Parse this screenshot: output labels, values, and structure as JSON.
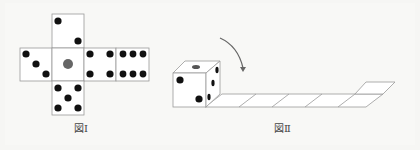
{
  "figure1": {
    "caption": "図Ⅰ",
    "faces": [
      {
        "position": "top",
        "pips": 2
      },
      {
        "position": "left",
        "pips": 3
      },
      {
        "position": "center",
        "pips": 1,
        "pip_color": "#666666"
      },
      {
        "position": "right",
        "pips": 4
      },
      {
        "position": "far-right",
        "pips": 6
      },
      {
        "position": "bottom",
        "pips": 5
      }
    ]
  },
  "figure2": {
    "caption": "図Ⅱ",
    "arrow": "curved-rotation-arrow",
    "track_squares": 6,
    "colors": {
      "line": "#999999",
      "pip": "#111111"
    }
  }
}
